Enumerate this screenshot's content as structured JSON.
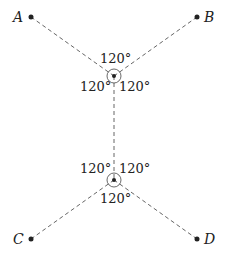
{
  "diagram": {
    "type": "steiner-tree",
    "terminals": [
      {
        "id": "A",
        "label": "A",
        "x": 31,
        "y": 17
      },
      {
        "id": "B",
        "label": "B",
        "x": 197,
        "y": 17
      },
      {
        "id": "C",
        "label": "C",
        "x": 31,
        "y": 239
      },
      {
        "id": "D",
        "label": "D",
        "x": 197,
        "y": 239
      }
    ],
    "steiner_points": [
      {
        "id": "S1",
        "x": 114,
        "y": 76
      },
      {
        "id": "S2",
        "x": 114,
        "y": 180
      }
    ],
    "edges": [
      {
        "from": "A",
        "to": "S1",
        "style": "dashed"
      },
      {
        "from": "B",
        "to": "S1",
        "style": "dashed"
      },
      {
        "from": "S1",
        "to": "S2",
        "style": "dashed"
      },
      {
        "from": "C",
        "to": "S2",
        "style": "dashed"
      },
      {
        "from": "D",
        "to": "S2",
        "style": "dashed"
      }
    ],
    "angle_labels": {
      "s1_top": "120°",
      "s1_left": "120°",
      "s1_right": "120°",
      "s2_left": "120°",
      "s2_right": "120°",
      "s2_bottom": "120°"
    },
    "colors": {
      "line": "#555555",
      "point": "#222222",
      "text": "#222222"
    }
  }
}
